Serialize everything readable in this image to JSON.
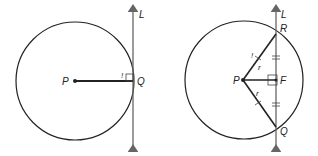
{
  "figures": [
    {
      "name": "tangent-radius-perpendicular",
      "labels": {
        "center": "P",
        "tangent_point": "Q",
        "line": "L",
        "right_angle_mark": "!"
      }
    },
    {
      "name": "secant-chord-midpoint",
      "labels": {
        "center": "P",
        "top_point": "R",
        "bottom_point": "Q",
        "foot": "F",
        "line": "L",
        "radius_top": "r",
        "radius_bottom": "r",
        "mark": "!"
      }
    }
  ],
  "colors": {
    "stroke": "#222222",
    "line": "#666666"
  }
}
